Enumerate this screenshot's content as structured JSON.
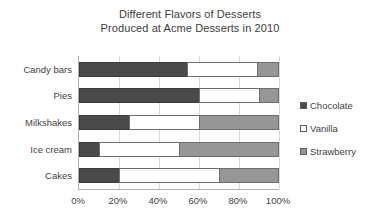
{
  "chart_data": {
    "type": "bar",
    "orientation": "horizontal",
    "stacked": true,
    "title": "Different Flavors of Desserts Produced at Acme Desserts in 2010",
    "title_lines": [
      "Different Flavors of Desserts",
      "Produced at Acme Desserts in 2010"
    ],
    "categories": [
      "Candy bars",
      "Pies",
      "Milkshakes",
      "Ice cream",
      "Cakes"
    ],
    "series": [
      {
        "name": "Chocolate",
        "values": [
          54,
          60,
          25,
          10,
          20
        ],
        "color": "#4a4a4a"
      },
      {
        "name": "Vanilla",
        "values": [
          35,
          30,
          35,
          40,
          50
        ],
        "color": "#ffffff"
      },
      {
        "name": "Strawberry",
        "values": [
          11,
          10,
          40,
          50,
          30
        ],
        "color": "#969696"
      }
    ],
    "xlabel": "",
    "ylabel": "",
    "xlim": [
      0,
      100
    ],
    "xticks": [
      0,
      20,
      40,
      60,
      80,
      100
    ],
    "xtick_labels": [
      "0%",
      "20%",
      "40%",
      "60%",
      "80%",
      "100%"
    ],
    "grid": true,
    "grid_axis": "x",
    "legend_position": "right",
    "unit": "%"
  },
  "axis": {
    "x_tick_labels": [
      "0%",
      "20%",
      "40%",
      "60%",
      "80%",
      "100%"
    ],
    "x_tick_values": [
      0,
      20,
      40,
      60,
      80,
      100
    ]
  },
  "legend": {
    "items": [
      {
        "label": "Chocolate",
        "color": "#4a4a4a"
      },
      {
        "label": "Vanilla",
        "color": "#ffffff"
      },
      {
        "label": "Strawberry",
        "color": "#969696"
      }
    ]
  }
}
